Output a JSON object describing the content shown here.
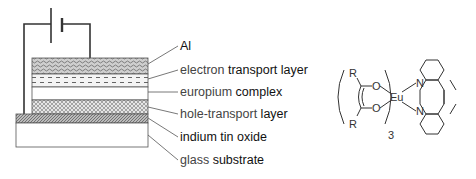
{
  "diagram": {
    "layers": [
      {
        "id": "al",
        "label_first": "Al",
        "label_rest": "",
        "pattern": "wavy"
      },
      {
        "id": "etl",
        "label_first": "electron",
        "label_rest": " transport layer",
        "pattern": "dashed"
      },
      {
        "id": "eu",
        "label_first": "europium",
        "label_rest": " complex",
        "pattern": "blank"
      },
      {
        "id": "htl",
        "label_first": "hole-transport",
        "label_rest": " layer",
        "pattern": "crosshatch"
      },
      {
        "id": "ito",
        "label_first": "indium",
        "label_rest": " tin oxide",
        "pattern": "diagonal"
      },
      {
        "id": "glass",
        "label_first": "glass",
        "label_rest": " substrate",
        "pattern": "blank"
      }
    ],
    "circuit": {
      "element": "battery"
    },
    "molecule": {
      "metal": "Eu",
      "ligand_substituent": "R",
      "oxygen": "O",
      "nitrogen": "N",
      "subscript": "3",
      "ligand_type": "beta-diketonate",
      "neutral_ligand": "1,10-phenanthroline"
    }
  }
}
